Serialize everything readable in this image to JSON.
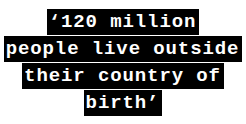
{
  "graphic": {
    "type": "pull-quote",
    "colors": {
      "background": "#ffffff",
      "highlight": "#000000",
      "text": "#ffffff"
    },
    "full_text": "‘120 million people live outside their country of birth’",
    "lines": [
      {
        "text": "‘120 million"
      },
      {
        "text": "people live outside"
      },
      {
        "text": "their country of"
      },
      {
        "text": "birth’"
      }
    ]
  }
}
